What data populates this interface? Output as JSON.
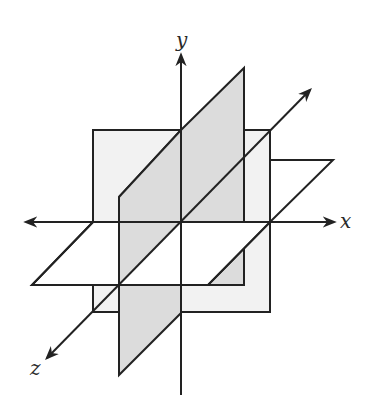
{
  "figure": {
    "axes": {
      "x_label": "x",
      "y_label": "y",
      "z_label": "z"
    },
    "planes": [
      "xy-plane",
      "yz-plane",
      "xz-plane"
    ],
    "colors": {
      "stroke": "#222222",
      "xy_plane_fill": "#f2f2f2",
      "yz_plane_fill": "#dcdcdc",
      "xz_plane_fill": "#ffffff",
      "background": "#ffffff"
    }
  }
}
